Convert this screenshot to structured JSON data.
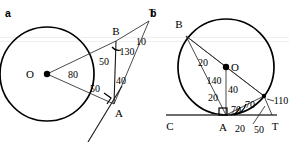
{
  "figure": {
    "type": "geometry-diagram",
    "background_color": "#ffffff",
    "stroke_color": "#000000",
    "width": 289,
    "height": 142,
    "panels": [
      {
        "id": "a",
        "panel_label": "a",
        "description": "Circle with center O, points A and B on the circle, external point T with two tangent/secant lines meeting at T.",
        "points": [
          {
            "name": "O",
            "label": "O",
            "x": 47,
            "y": 74,
            "dot": true
          },
          {
            "name": "B",
            "label": "B",
            "x": 116,
            "y": 41,
            "dot": false
          },
          {
            "name": "A",
            "label": "A",
            "x": 114,
            "y": 104,
            "dot": false
          },
          {
            "name": "T",
            "label": "T",
            "x": 152,
            "y": 12,
            "dot": false
          }
        ],
        "angles": [
          {
            "name": "angle-O",
            "value": "80",
            "x": 73,
            "y": 74
          },
          {
            "name": "angle-B-inner",
            "value": "50",
            "x": 104,
            "y": 62
          },
          {
            "name": "angle-B-outer",
            "value": "130",
            "x": 125,
            "y": 52
          },
          {
            "name": "angle-T",
            "value": "10",
            "x": 140,
            "y": 42
          },
          {
            "name": "angle-A-inner",
            "value": "50",
            "x": 95,
            "y": 89
          },
          {
            "name": "angle-A-outer",
            "value": "40",
            "x": 120,
            "y": 80
          }
        ],
        "circle": {
          "cx": 47,
          "cy": 74,
          "r": 47
        },
        "right_angle_at": "A"
      },
      {
        "id": "b",
        "panel_label": "b",
        "description": "Circle with center O, chord AB, baseline C-A-T tangent at A, point on circle at right with tangent to T.",
        "points": [
          {
            "name": "O",
            "label": "O",
            "x": 226,
            "y": 67,
            "dot": true
          },
          {
            "name": "B",
            "label": "B",
            "x": 186,
            "y": 29,
            "dot": false
          },
          {
            "name": "A",
            "label": "A",
            "x": 226,
            "y": 123,
            "dot": false
          },
          {
            "name": "C",
            "label": "C",
            "x": 172,
            "y": 125,
            "dot": false
          },
          {
            "name": "T",
            "label": "T",
            "x": 273,
            "y": 125,
            "dot": false
          }
        ],
        "angles": [
          {
            "name": "angle-B",
            "value": "20",
            "x": 202,
            "y": 62
          },
          {
            "name": "angle-O-top",
            "value": "140",
            "x": 213,
            "y": 80
          },
          {
            "name": "angle-O-right",
            "value": "40",
            "x": 231,
            "y": 90
          },
          {
            "name": "angle-left-lower",
            "value": "20",
            "x": 212,
            "y": 97
          },
          {
            "name": "angle-A-left",
            "value": "70",
            "x": 234,
            "y": 110
          },
          {
            "name": "angle-A-right",
            "value": "70",
            "x": 249,
            "y": 106
          },
          {
            "name": "angle-110",
            "value": "110",
            "x": 268,
            "y": 110
          },
          {
            "name": "angle-A-base",
            "value": "20",
            "x": 239,
            "y": 130
          },
          {
            "name": "angle-T-base",
            "value": "50",
            "x": 258,
            "y": 131
          }
        ],
        "circle": {
          "cx": 226,
          "cy": 67,
          "r": 48
        },
        "right_angle_at": "A"
      }
    ]
  }
}
